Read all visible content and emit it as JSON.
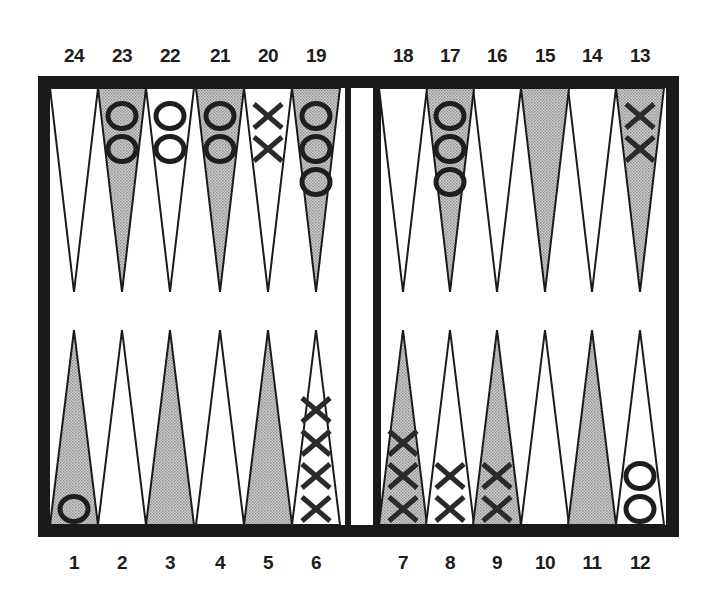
{
  "game": "backgammon",
  "colors": {
    "frame": "#1a1a1a",
    "shaded_point": "#b8b8b8",
    "white_point": "#ffffff",
    "checker_stroke": "#1e1e1e"
  },
  "point_labels": {
    "top": [
      "24",
      "23",
      "22",
      "21",
      "20",
      "19",
      "18",
      "17",
      "16",
      "15",
      "14",
      "13"
    ],
    "bottom": [
      "1",
      "2",
      "3",
      "4",
      "5",
      "6",
      "7",
      "8",
      "9",
      "10",
      "11",
      "12"
    ]
  },
  "points": [
    {
      "n": 1,
      "shaded": true,
      "checker": "O",
      "count": 1
    },
    {
      "n": 2,
      "shaded": false,
      "checker": null,
      "count": 0
    },
    {
      "n": 3,
      "shaded": true,
      "checker": null,
      "count": 0
    },
    {
      "n": 4,
      "shaded": false,
      "checker": null,
      "count": 0
    },
    {
      "n": 5,
      "shaded": true,
      "checker": null,
      "count": 0
    },
    {
      "n": 6,
      "shaded": false,
      "checker": "X",
      "count": 4
    },
    {
      "n": 7,
      "shaded": true,
      "checker": "X",
      "count": 3
    },
    {
      "n": 8,
      "shaded": false,
      "checker": "X",
      "count": 2
    },
    {
      "n": 9,
      "shaded": true,
      "checker": "X",
      "count": 2
    },
    {
      "n": 10,
      "shaded": false,
      "checker": null,
      "count": 0
    },
    {
      "n": 11,
      "shaded": true,
      "checker": null,
      "count": 0
    },
    {
      "n": 12,
      "shaded": false,
      "checker": "O",
      "count": 2
    },
    {
      "n": 13,
      "shaded": true,
      "checker": "X",
      "count": 2
    },
    {
      "n": 14,
      "shaded": false,
      "checker": null,
      "count": 0
    },
    {
      "n": 15,
      "shaded": true,
      "checker": null,
      "count": 0
    },
    {
      "n": 16,
      "shaded": false,
      "checker": null,
      "count": 0
    },
    {
      "n": 17,
      "shaded": true,
      "checker": "O",
      "count": 3
    },
    {
      "n": 18,
      "shaded": false,
      "checker": null,
      "count": 0
    },
    {
      "n": 19,
      "shaded": true,
      "checker": "O",
      "count": 3
    },
    {
      "n": 20,
      "shaded": false,
      "checker": "X",
      "count": 2
    },
    {
      "n": 21,
      "shaded": true,
      "checker": "O",
      "count": 2
    },
    {
      "n": 22,
      "shaded": false,
      "checker": "O",
      "count": 2
    },
    {
      "n": 23,
      "shaded": true,
      "checker": "O",
      "count": 2
    },
    {
      "n": 24,
      "shaded": false,
      "checker": null,
      "count": 0
    }
  ]
}
